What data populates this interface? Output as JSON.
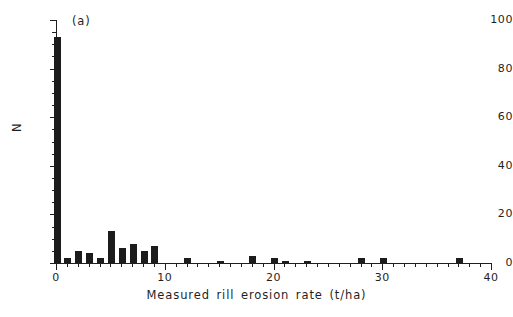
{
  "chart_data": {
    "type": "bar",
    "title": "",
    "panel_label": "(a)",
    "xlabel": "Measured rill erosion rate (t/ha)",
    "ylabel": "N",
    "xlim": [
      0,
      40
    ],
    "ylim": [
      0,
      100
    ],
    "xticks": [
      0,
      10,
      20,
      30,
      40
    ],
    "xtick_labels": [
      "0",
      "10",
      "20",
      "30",
      "40"
    ],
    "yticks": [
      0,
      20,
      40,
      60,
      80,
      100
    ],
    "ytick_labels": [
      "0",
      "20",
      "40",
      "60",
      "80",
      "100"
    ],
    "x_minor_tick_step": 1,
    "y_minor_tick_step": 5,
    "grid": false,
    "legend": false,
    "bar_color": "#1c1c1c",
    "axis_color": "#1f1f1f",
    "background_color": "#ffffff",
    "bin_width": 1,
    "x": [
      0,
      1,
      2,
      3,
      4,
      5,
      6,
      7,
      8,
      9,
      12,
      15,
      18,
      20,
      21,
      23,
      28,
      30,
      37
    ],
    "values": [
      93,
      2,
      5,
      4,
      2,
      13,
      6,
      8,
      5,
      7,
      2,
      1,
      3,
      2,
      1,
      1,
      2,
      2,
      2
    ],
    "bars": [
      {
        "x": 0,
        "value": 93
      },
      {
        "x": 1,
        "value": 2
      },
      {
        "x": 2,
        "value": 5
      },
      {
        "x": 3,
        "value": 4
      },
      {
        "x": 4,
        "value": 2
      },
      {
        "x": 5,
        "value": 13
      },
      {
        "x": 6,
        "value": 6
      },
      {
        "x": 7,
        "value": 8
      },
      {
        "x": 8,
        "value": 5
      },
      {
        "x": 9,
        "value": 7
      },
      {
        "x": 12,
        "value": 2
      },
      {
        "x": 15,
        "value": 1
      },
      {
        "x": 18,
        "value": 3
      },
      {
        "x": 20,
        "value": 2
      },
      {
        "x": 21,
        "value": 1
      },
      {
        "x": 23,
        "value": 1
      },
      {
        "x": 28,
        "value": 2
      },
      {
        "x": 30,
        "value": 2
      },
      {
        "x": 37,
        "value": 2
      }
    ]
  }
}
